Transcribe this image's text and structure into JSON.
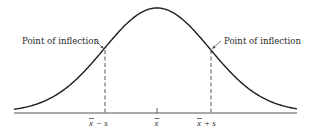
{
  "figure": {
    "colors": {
      "curve": "#1e1e1e",
      "axis": "#555555",
      "dashed": "#444444",
      "text": "#2a2a2a"
    },
    "annotations": {
      "left_inflection_label": "Point of inflection",
      "right_inflection_label": "Point of inflection"
    },
    "axis_labels": {
      "mean_minus_s": {
        "bar": "x",
        "rest": "− s"
      },
      "mean": {
        "bar": "x",
        "rest": ""
      },
      "mean_plus_s": {
        "bar": "x",
        "rest": "+ s"
      }
    }
  },
  "chart_data": {
    "type": "line",
    "title": "",
    "xlabel": "",
    "ylabel": "",
    "curve": "normal (bell-shaped) density",
    "tick_labels": [
      "x̄ − s",
      "x̄",
      "x̄ + s"
    ],
    "annotations": [
      "Point of inflection",
      "Point of inflection"
    ],
    "inflection_points_at": [
      "x̄ − s",
      "x̄ + s"
    ],
    "grid": false
  }
}
